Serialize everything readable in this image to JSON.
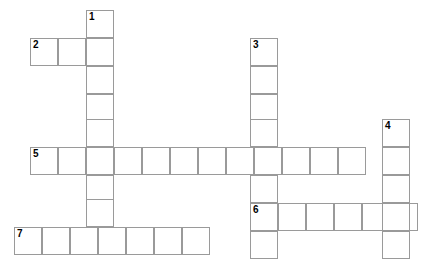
{
  "puzzle": {
    "type": "crossword-grid",
    "width_px": 446,
    "height_px": 280,
    "cell_size_px": 28,
    "background_color": "#ffffff",
    "cell_fill_color": "#ffffff",
    "cell_border_color": "#9a9a9a",
    "number_color": "#000000",
    "blank_cells": true,
    "numbered_entries": [
      {
        "number": "1",
        "direction": "down",
        "length": 8,
        "start_x": 86,
        "start_y": 10
      },
      {
        "number": "2",
        "direction": "across",
        "length": 3,
        "start_x": 30,
        "start_y": 38
      },
      {
        "number": "3",
        "direction": "down",
        "length": 8,
        "start_x": 250,
        "start_y": 38
      },
      {
        "number": "4",
        "direction": "down",
        "length": 5,
        "start_x": 382,
        "start_y": 119
      },
      {
        "number": "5",
        "direction": "across",
        "length": 12,
        "start_x": 30,
        "start_y": 147
      },
      {
        "number": "6",
        "direction": "across",
        "length": 6,
        "start_x": 250,
        "start_y": 203
      },
      {
        "number": "7",
        "direction": "across",
        "length": 7,
        "start_x": 14,
        "start_y": 227
      }
    ],
    "cells": [
      {
        "x": 86,
        "y": 10,
        "number": "1"
      },
      {
        "x": 30,
        "y": 38,
        "number": "2"
      },
      {
        "x": 58,
        "y": 38,
        "number": ""
      },
      {
        "x": 86,
        "y": 38,
        "number": ""
      },
      {
        "x": 250,
        "y": 38,
        "number": "3"
      },
      {
        "x": 86,
        "y": 66,
        "number": ""
      },
      {
        "x": 250,
        "y": 66,
        "number": ""
      },
      {
        "x": 86,
        "y": 94,
        "number": ""
      },
      {
        "x": 250,
        "y": 94,
        "number": ""
      },
      {
        "x": 86,
        "y": 119,
        "number": ""
      },
      {
        "x": 250,
        "y": 119,
        "number": ""
      },
      {
        "x": 382,
        "y": 119,
        "number": "4"
      },
      {
        "x": 30,
        "y": 147,
        "number": "5"
      },
      {
        "x": 58,
        "y": 147,
        "number": ""
      },
      {
        "x": 86,
        "y": 147,
        "number": ""
      },
      {
        "x": 114,
        "y": 147,
        "number": ""
      },
      {
        "x": 142,
        "y": 147,
        "number": ""
      },
      {
        "x": 170,
        "y": 147,
        "number": ""
      },
      {
        "x": 198,
        "y": 147,
        "number": ""
      },
      {
        "x": 226,
        "y": 147,
        "number": ""
      },
      {
        "x": 254,
        "y": 147,
        "number": ""
      },
      {
        "x": 282,
        "y": 147,
        "number": ""
      },
      {
        "x": 310,
        "y": 147,
        "number": ""
      },
      {
        "x": 338,
        "y": 147,
        "number": ""
      },
      {
        "x": 382,
        "y": 147,
        "number": ""
      },
      {
        "x": 86,
        "y": 175,
        "number": ""
      },
      {
        "x": 250,
        "y": 175,
        "number": ""
      },
      {
        "x": 382,
        "y": 175,
        "number": ""
      },
      {
        "x": 86,
        "y": 199,
        "number": ""
      },
      {
        "x": 250,
        "y": 203,
        "number": "6"
      },
      {
        "x": 278,
        "y": 203,
        "number": ""
      },
      {
        "x": 306,
        "y": 203,
        "number": ""
      },
      {
        "x": 334,
        "y": 203,
        "number": ""
      },
      {
        "x": 362,
        "y": 203,
        "number": ""
      },
      {
        "x": 390,
        "y": 203,
        "number": ""
      },
      {
        "x": 382,
        "y": 203,
        "number": ""
      },
      {
        "x": 14,
        "y": 227,
        "number": "7"
      },
      {
        "x": 42,
        "y": 227,
        "number": ""
      },
      {
        "x": 70,
        "y": 227,
        "number": ""
      },
      {
        "x": 98,
        "y": 227,
        "number": ""
      },
      {
        "x": 126,
        "y": 227,
        "number": ""
      },
      {
        "x": 154,
        "y": 227,
        "number": ""
      },
      {
        "x": 182,
        "y": 227,
        "number": ""
      },
      {
        "x": 250,
        "y": 231,
        "number": ""
      },
      {
        "x": 382,
        "y": 231,
        "number": ""
      }
    ]
  }
}
